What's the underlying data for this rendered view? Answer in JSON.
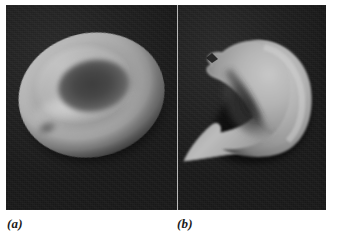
{
  "figure": {
    "kind": "scanning-electron-micrograph-pair",
    "background_color": "#ffffff",
    "plate_background_color": "#1e1e1e",
    "cell_highlight_color": "#b6b6b6",
    "divider_color": "#b9b9b9"
  },
  "panels": [
    {
      "id": "a",
      "caption": "(a)",
      "subject": "normal biconcave red blood cell (discocyte)",
      "icon": "discocyte-cell",
      "description": "Donut-shaped erythrocyte seen obliquely, with a smooth raised rim and a dark central concave depression."
    },
    {
      "id": "b",
      "caption": "(b)",
      "subject": "sickled red blood cell (drepanocyte)",
      "icon": "sickle-cell",
      "description": "Crescent-shaped erythrocyte with sharply pointed ends and a deep concave notch along its left side."
    }
  ],
  "captions": {
    "a": "(a)",
    "b": "(b)"
  }
}
